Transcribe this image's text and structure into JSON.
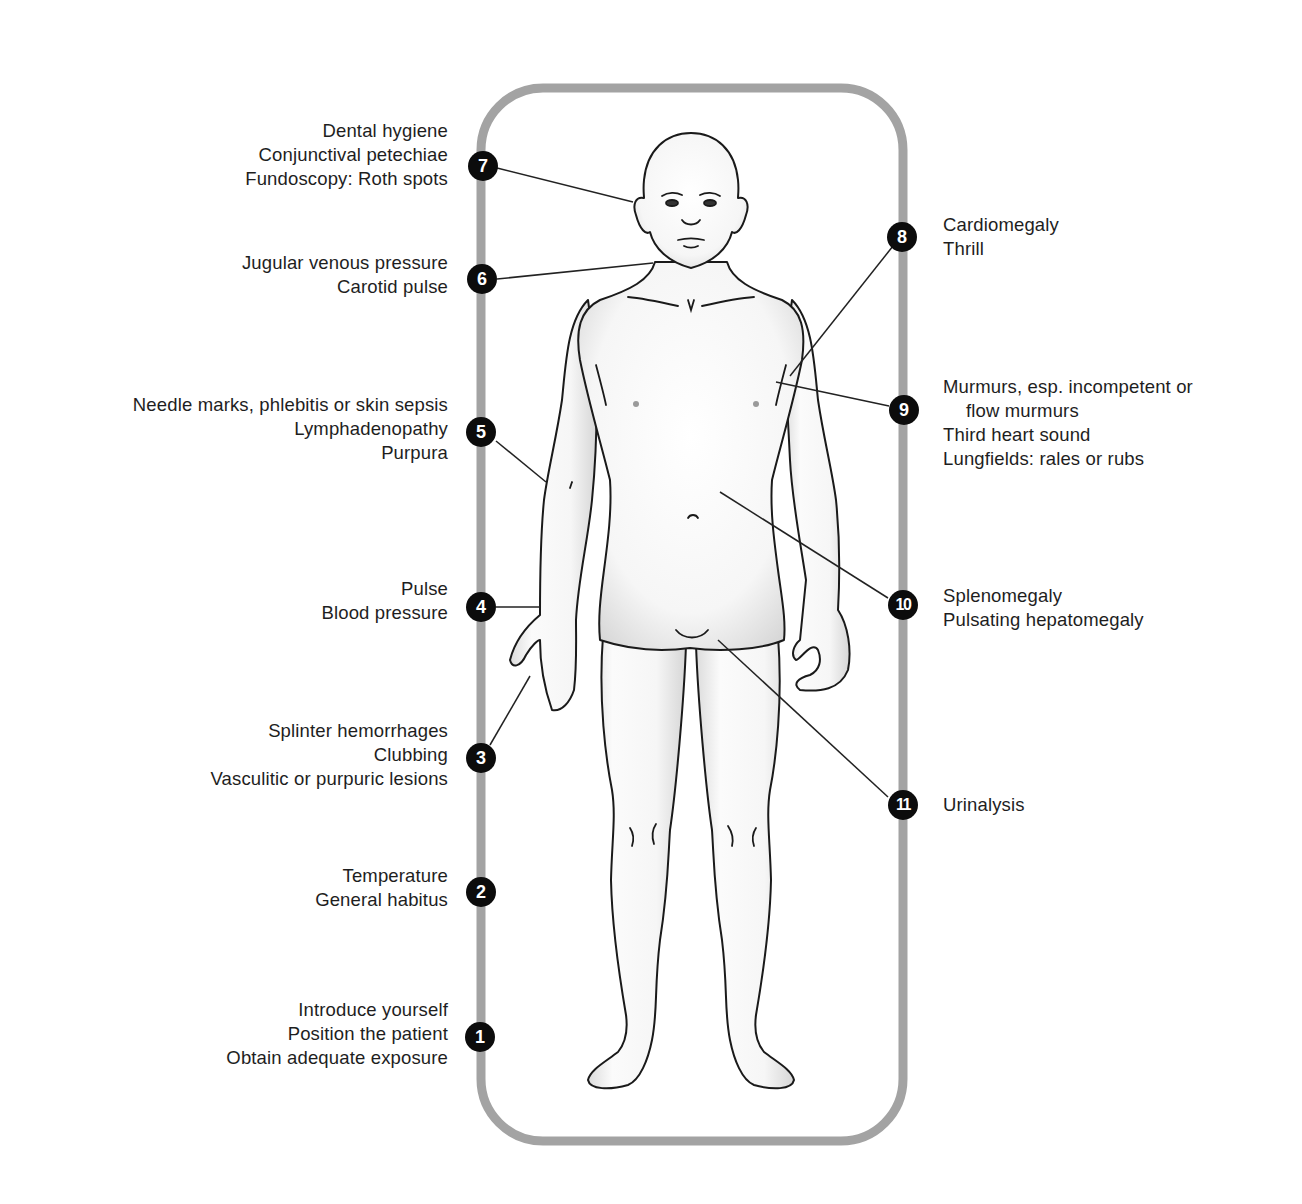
{
  "diagram": {
    "type": "anatomical-checklist",
    "frame_color": "#a3a3a3",
    "marker_color": "#0c0c0c",
    "line_color": "#222222",
    "items": [
      {
        "number": "1",
        "side": "left",
        "lines": [
          "Introduce yourself",
          "Position the patient",
          "Obtain adequate exposure"
        ]
      },
      {
        "number": "2",
        "side": "left",
        "lines": [
          "Temperature",
          "General habitus"
        ]
      },
      {
        "number": "3",
        "side": "left",
        "lines": [
          "Splinter hemorrhages",
          "Clubbing",
          "Vasculitic or purpuric lesions"
        ]
      },
      {
        "number": "4",
        "side": "left",
        "lines": [
          "Pulse",
          "Blood pressure"
        ]
      },
      {
        "number": "5",
        "side": "left",
        "lines": [
          "Needle marks, phlebitis or skin sepsis",
          "Lymphadenopathy",
          "Purpura"
        ]
      },
      {
        "number": "6",
        "side": "left",
        "lines": [
          "Jugular venous pressure",
          "Carotid pulse"
        ]
      },
      {
        "number": "7",
        "side": "left",
        "lines": [
          "Dental hygiene",
          "Conjunctival petechiae",
          "Fundoscopy: Roth spots"
        ]
      },
      {
        "number": "8",
        "side": "right",
        "lines": [
          "Cardiomegaly",
          "Thrill"
        ]
      },
      {
        "number": "9",
        "side": "right",
        "lines": [
          "Murmurs, esp. incompetent or",
          "flow murmurs",
          "Third heart sound",
          "Lungfields: rales or rubs"
        ]
      },
      {
        "number": "10",
        "side": "right",
        "lines": [
          "Splenomegaly",
          "Pulsating hepatomegaly"
        ]
      },
      {
        "number": "11",
        "side": "right",
        "lines": [
          "Urinalysis"
        ]
      }
    ]
  }
}
